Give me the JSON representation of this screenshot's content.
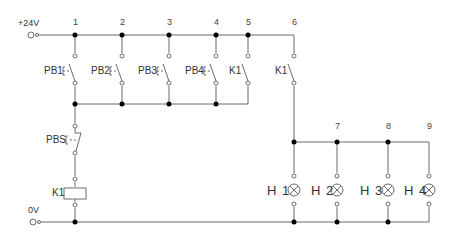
{
  "diagram": {
    "type": "ladder-circuit",
    "colors": {
      "wire": "#6b6b6b",
      "junction": "#000000",
      "text": "#333333"
    },
    "supply": {
      "positive_label": "+24V",
      "negative_label": "0V"
    },
    "nodes": [
      "1",
      "2",
      "3",
      "4",
      "5",
      "6",
      "7",
      "8",
      "9"
    ],
    "switches": [
      {
        "label": "PB1",
        "type": "pushbutton-no"
      },
      {
        "label": "PB2",
        "type": "pushbutton-no"
      },
      {
        "label": "PB3",
        "type": "pushbutton-no"
      },
      {
        "label": "PB4",
        "type": "pushbutton-no"
      },
      {
        "label": "K1",
        "type": "contact-no"
      },
      {
        "label": "K1",
        "type": "contact-no"
      }
    ],
    "stop_button": {
      "label": "PBS",
      "type": "pushbutton-nc"
    },
    "coil": {
      "label": "K1"
    },
    "lamps": [
      {
        "label": "H 1"
      },
      {
        "label": "H 2"
      },
      {
        "label": "H 3"
      },
      {
        "label": "H 4"
      }
    ]
  }
}
